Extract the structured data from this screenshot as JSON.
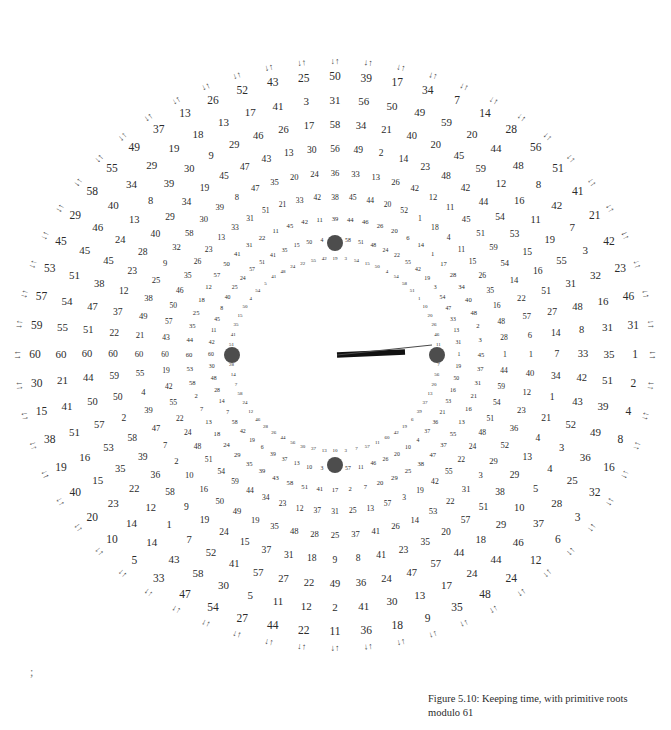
{
  "figure": {
    "caption": "Figure 5.10: Keeping time, with primitive roots modulo 61",
    "modulus": 61,
    "stray_mark": ";",
    "colors": {
      "ink": "#2b2b2b",
      "dot": "#4d4d4d",
      "hour_hand": "#111111",
      "minute_hand": "#4a4a4a",
      "background": "#ffffff"
    }
  },
  "dial": {
    "center_x": 335,
    "center_y": 355,
    "positions": 60,
    "start_angle_deg": 180,
    "face_dots": [
      {
        "name": "dot-12",
        "x": 335,
        "y": 243,
        "r": 8
      },
      {
        "name": "dot-9",
        "x": 232,
        "y": 355,
        "r": 8
      },
      {
        "name": "dot-3",
        "x": 437,
        "y": 355,
        "r": 8
      },
      {
        "name": "dot-6",
        "x": 335,
        "y": 465,
        "r": 8
      }
    ],
    "hands": [
      {
        "name": "hour-hand",
        "x1": 337,
        "y1": 355,
        "x2": 405,
        "y2": 352,
        "width": 5.5
      },
      {
        "name": "minute-hand",
        "x1": 337,
        "y1": 355,
        "x2": 432,
        "y2": 345,
        "width": 1.1
      }
    ]
  },
  "rings": [
    {
      "index": 0,
      "label": "ring-outer-arrows",
      "radius": 300,
      "font_size": 11.5,
      "generator": 2,
      "values": [
        60,
        59,
        58,
        57,
        56,
        55,
        54,
        53,
        52,
        51,
        50,
        49,
        48,
        47,
        46,
        45,
        44,
        43,
        42,
        41,
        40,
        39,
        38,
        37,
        36,
        35,
        34,
        33,
        32,
        31,
        30,
        29,
        28,
        27,
        26,
        25,
        24,
        23,
        22,
        21,
        20,
        19,
        18,
        17,
        16,
        15,
        14,
        13,
        12,
        11,
        10,
        9,
        8,
        7,
        6,
        5,
        4,
        3,
        2,
        1
      ],
      "visible_values": [
        60,
        59,
        57,
        53,
        45,
        29,
        58,
        55,
        49,
        37,
        13,
        26,
        52,
        43,
        25,
        50,
        39,
        17,
        34,
        7,
        14,
        28,
        56,
        51,
        41,
        21,
        42,
        23,
        46,
        31,
        1,
        2,
        4,
        8,
        16,
        32,
        3,
        6,
        12,
        24,
        48,
        35,
        9,
        18,
        36,
        11,
        22,
        44,
        27,
        54,
        47,
        33,
        5,
        10,
        20,
        40,
        19,
        38,
        15,
        30
      ],
      "arrow_pairs": true
    },
    {
      "index": 1,
      "label": "ring-1",
      "radius": 274,
      "font_size": 11.0,
      "generator": 6,
      "values": [
        60,
        10,
        55,
        25,
        58,
        45,
        34,
        18,
        44,
        49,
        20,
        35,
        24,
        8,
        31,
        51,
        19,
        11,
        50,
        56,
        31,
        3,
        18,
        47,
        38,
        45,
        26,
        34,
        21,
        40,
        30,
        51,
        6,
        36,
        3,
        16,
        35,
        57,
        47,
        25,
        41,
        46,
        29,
        13,
        8,
        24,
        47,
        59,
        55,
        16,
        59,
        52,
        31,
        56,
        50,
        49,
        59,
        20,
        44,
        48
      ],
      "visible_values": [
        60,
        55,
        54,
        51,
        45,
        46,
        40,
        34,
        29,
        19,
        18,
        13,
        17,
        41,
        3,
        31,
        56,
        50,
        49,
        59,
        20,
        44,
        48,
        8,
        42,
        7,
        3,
        32,
        16,
        31,
        35,
        51,
        39,
        49,
        36,
        25,
        28,
        37,
        46,
        44,
        24,
        17,
        13,
        30,
        41,
        2,
        12,
        11,
        5,
        30,
        58,
        43,
        14,
        14,
        23,
        15,
        16,
        51,
        41,
        21
      ]
    },
    {
      "index": 2,
      "label": "ring-2",
      "radius": 248,
      "font_size": 10.5,
      "generator": 7,
      "values": [
        60,
        51,
        47,
        38,
        45,
        24,
        13,
        8,
        39,
        30,
        9,
        29,
        46,
        26,
        17,
        58,
        34,
        21,
        40,
        20,
        45,
        59,
        12,
        16,
        11,
        19,
        55,
        31,
        48,
        8,
        33,
        42,
        43,
        52,
        3,
        4,
        5,
        10,
        29,
        18,
        44,
        57,
        47,
        24,
        36,
        49,
        22,
        27,
        57,
        41,
        52,
        7,
        1,
        12,
        22,
        35,
        53,
        57,
        50,
        44
      ],
      "visible_values": [
        60,
        51,
        47,
        38,
        45,
        24,
        13,
        8,
        39,
        30,
        9,
        29,
        46,
        26,
        17,
        58,
        34,
        21,
        40,
        20,
        45,
        59,
        12,
        16,
        11,
        19,
        55,
        31,
        48,
        8,
        33,
        42,
        43,
        52,
        3,
        4,
        5,
        10,
        29,
        18,
        44,
        57,
        47,
        24,
        36,
        49,
        22,
        27,
        57,
        41,
        52,
        7,
        1,
        12,
        22,
        35,
        53,
        57,
        50,
        44
      ]
    },
    {
      "index": 3,
      "label": "ring-3",
      "radius": 222,
      "font_size": 9.6,
      "generator": 10,
      "values": [
        60,
        22,
        37,
        12,
        23,
        28,
        40,
        29,
        34,
        19,
        45,
        47,
        43,
        13,
        30,
        56,
        49,
        2,
        14,
        23,
        48,
        42,
        44,
        54,
        53,
        15,
        16,
        51,
        27,
        14,
        7,
        34,
        1,
        21,
        4,
        13,
        29,
        38,
        51,
        57,
        20,
        35,
        23,
        41,
        8,
        9,
        18,
        31,
        37,
        15,
        24,
        19,
        9,
        58,
        36,
        39,
        58,
        2,
        50,
        59
      ],
      "visible_values": [
        60,
        22,
        37,
        12,
        23,
        28,
        40,
        29,
        34,
        19,
        45,
        47,
        43,
        13,
        30,
        56,
        49,
        2,
        14,
        23,
        48,
        42,
        44,
        54,
        53,
        15,
        16,
        51,
        27,
        14,
        7,
        34,
        1,
        21,
        4,
        13,
        29,
        38,
        51,
        57,
        20,
        35,
        23,
        41,
        8,
        9,
        18,
        31,
        37,
        15,
        24,
        19,
        9,
        58,
        36,
        39,
        58,
        2,
        50,
        59
      ]
    },
    {
      "index": 4,
      "label": "ring-4",
      "radius": 196,
      "font_size": 8.6,
      "generator": 17,
      "values": [
        60,
        21,
        49,
        38,
        25,
        9,
        32,
        58,
        30,
        39,
        8,
        47,
        35,
        20,
        24,
        36,
        33,
        13,
        26,
        42,
        12,
        11,
        45,
        51,
        59,
        54,
        14,
        22,
        57,
        6,
        1,
        40,
        12,
        23,
        36,
        52,
        29,
        3,
        31,
        22,
        53,
        14,
        26,
        41,
        37,
        25,
        28,
        48,
        35,
        19,
        49,
        50,
        16,
        10,
        2,
        7,
        47,
        39,
        4,
        55
      ],
      "visible_values": [
        60,
        21,
        49,
        38,
        25,
        9,
        32,
        58,
        30,
        39,
        8,
        47,
        35,
        20,
        24,
        36,
        33,
        13,
        26,
        42,
        12,
        11,
        45,
        51,
        59,
        54,
        14,
        22,
        57,
        6,
        1,
        40,
        12,
        23,
        36,
        52,
        29,
        3,
        31,
        22,
        53,
        14,
        26,
        41,
        37,
        25,
        28,
        48,
        35,
        19,
        49,
        50,
        16,
        10,
        2,
        7,
        47,
        39,
        4,
        55
      ]
    },
    {
      "index": 5,
      "label": "ring-5",
      "radius": 170,
      "font_size": 7.6,
      "generator": 26,
      "values": [
        60,
        43,
        57,
        50,
        46,
        35,
        26,
        23,
        13,
        33,
        31,
        51,
        21,
        33,
        42,
        38,
        45,
        44,
        20,
        52,
        1,
        18,
        4,
        11,
        15,
        26,
        35,
        16,
        48,
        28,
        1,
        18,
        4,
        11,
        15,
        26,
        35,
        16,
        48,
        28,
        22,
        55,
        42,
        19,
        3,
        54,
        58,
        51,
        48,
        24,
        60,
        43,
        57,
        50,
        46,
        35,
        26,
        23,
        13,
        33
      ],
      "visible_values": [
        60,
        43,
        57,
        50,
        46,
        35,
        26,
        23,
        13,
        33,
        31,
        51,
        21,
        33,
        42,
        38,
        45,
        44,
        20,
        52,
        1,
        18,
        4,
        11,
        15,
        26,
        35,
        16,
        48,
        28,
        1,
        44,
        59,
        54,
        51,
        48,
        24,
        22,
        55,
        42,
        19,
        3,
        57,
        13,
        25,
        31,
        37,
        12,
        23,
        34,
        44,
        59,
        54,
        51,
        48,
        24,
        22,
        55,
        42,
        19
      ]
    },
    {
      "index": 6,
      "label": "ring-6",
      "radius": 146,
      "font_size": 6.6,
      "generator": 29,
      "values": [
        60,
        44,
        35,
        25,
        18,
        12,
        57,
        50,
        41,
        31,
        22,
        11,
        45,
        42,
        11,
        39,
        44,
        46,
        26,
        20,
        6,
        14,
        1,
        17,
        28,
        34,
        40,
        48,
        2,
        3,
        45,
        37,
        31,
        21,
        16,
        13,
        55,
        37,
        47,
        38,
        25,
        29,
        20,
        7,
        2,
        17,
        41,
        51,
        58,
        43,
        39,
        35,
        29,
        24,
        18,
        13,
        7,
        2,
        58,
        53
      ],
      "visible_values": [
        60,
        44,
        35,
        25,
        18,
        12,
        57,
        50,
        41,
        31,
        22,
        11,
        45,
        42,
        11,
        39,
        44,
        46,
        26,
        20,
        6,
        14,
        1,
        17,
        28,
        34,
        40,
        48,
        2,
        3,
        45,
        37,
        31,
        21,
        16,
        13,
        55,
        37,
        47,
        38,
        25,
        29,
        20,
        7,
        2,
        17,
        41,
        51,
        58,
        43,
        39,
        35,
        29,
        24,
        18,
        13,
        7,
        2,
        58,
        53
      ]
    },
    {
      "index": 7,
      "label": "ring-7",
      "radius": 124,
      "font_size": 5.8,
      "generator": 35,
      "values": [
        60,
        42,
        11,
        45,
        8,
        40,
        25,
        24,
        57,
        51,
        41,
        35,
        15,
        50,
        4,
        54,
        58,
        51,
        48,
        24,
        22,
        55,
        42,
        19,
        3,
        54,
        47,
        33,
        13,
        31,
        1,
        19,
        50,
        16,
        53,
        21,
        36,
        37,
        4,
        10,
        20,
        26,
        46,
        11,
        57,
        7,
        3,
        10,
        13,
        37,
        39,
        6,
        19,
        42,
        58,
        7,
        14,
        28,
        48,
        30
      ],
      "visible_values": [
        60,
        42,
        11,
        45,
        8,
        40,
        25,
        24,
        57,
        51,
        41,
        35,
        15,
        50,
        4,
        54,
        58,
        51,
        48,
        24,
        22,
        55,
        42,
        19,
        3,
        54,
        47,
        33,
        13,
        31,
        1,
        19,
        50,
        16,
        53,
        21,
        36,
        37,
        4,
        10,
        20,
        26,
        46,
        11,
        57,
        7,
        3,
        10,
        13,
        37,
        39,
        6,
        19,
        42,
        58,
        7,
        14,
        28,
        48,
        30
      ]
    },
    {
      "index": 8,
      "label": "ring-8",
      "radius": 104,
      "font_size": 5.0,
      "generator": 41,
      "values": [
        60,
        51,
        41,
        35,
        15,
        50,
        4,
        54,
        5,
        41,
        48,
        24,
        22,
        55,
        42,
        19,
        3,
        54,
        15,
        50,
        4,
        54,
        58,
        51,
        1,
        10,
        20,
        26,
        46,
        11,
        57,
        7,
        56,
        20,
        13,
        37,
        39,
        6,
        19,
        42,
        60,
        11,
        57,
        7,
        3,
        10,
        13,
        37,
        30,
        56,
        44,
        26,
        28,
        46,
        12,
        24,
        58,
        7,
        14,
        28
      ],
      "visible_values": [
        60,
        51,
        41,
        35,
        15,
        50,
        4,
        54,
        5,
        41,
        48,
        24,
        22,
        55,
        42,
        19,
        3,
        54,
        15,
        50,
        4,
        54,
        58,
        51,
        1,
        10,
        20,
        26,
        46,
        11,
        57,
        7,
        56,
        20,
        13,
        37,
        39,
        6,
        19,
        42,
        60,
        11,
        57,
        7,
        3,
        10,
        13,
        37,
        30,
        56,
        44,
        26,
        28,
        46,
        12,
        24,
        58,
        7,
        14,
        28
      ]
    }
  ],
  "spokes": {
    "cardinal_labels": {
      "west": "60",
      "east": "1",
      "note": "the 9-o'clock spoke is all 60s; the 3-o'clock spoke is all 1s"
    }
  },
  "arrows": {
    "glyph_left": "↓↑",
    "glyph_right": "↓↑",
    "glyph_top_left": "↙↗",
    "glyph_top_right": "↘↖",
    "glyph_top": "←→",
    "glyph_bottom": "←→"
  }
}
